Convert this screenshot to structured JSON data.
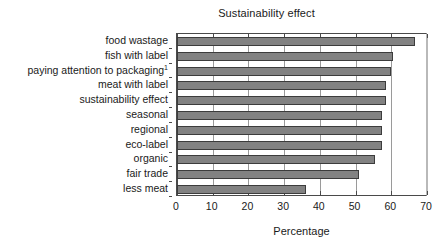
{
  "chart_data": {
    "type": "bar",
    "orientation": "horizontal",
    "title": "Sustainability effect",
    "xlabel": "Percentage",
    "ylabel": "",
    "xlim": [
      0,
      70
    ],
    "xticks": [
      0,
      10,
      20,
      30,
      40,
      50,
      60,
      70
    ],
    "xtick_labels": [
      "0",
      "10",
      "20",
      "30",
      "40",
      "50",
      "60",
      "70"
    ],
    "grid": true,
    "grid_axis": "x",
    "legend": false,
    "bar_color": "#828282",
    "bar_edge_color": "#3c3c3c",
    "categories": [
      "food wastage",
      "fish with label",
      "paying attention to packaging",
      "meat with label",
      "sustainability effect",
      "seasonal",
      "regional",
      "eco-label",
      "organic",
      "fair trade",
      "less meat"
    ],
    "category_superscripts": [
      "",
      "",
      "1",
      "",
      "",
      "",
      "",
      "",
      "",
      "",
      ""
    ],
    "values": [
      66.5,
      60.5,
      60.0,
      58.5,
      58.5,
      57.5,
      57.5,
      57.5,
      55.5,
      51.0,
      36.0
    ]
  },
  "footnote": ""
}
